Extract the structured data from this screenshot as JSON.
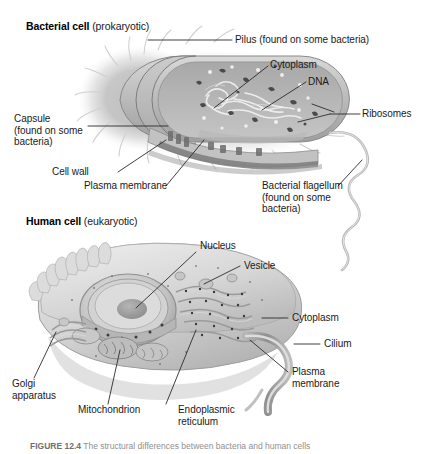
{
  "figure": {
    "background": "#ffffff",
    "line_color": "#2b2b2b",
    "text_color": "#1a1a1a",
    "caption_number": "FIGURE 12.4",
    "caption_text": "The structural differences between bacteria and human cells"
  },
  "sections": [
    {
      "id": "bacterial",
      "title_bold": "Bacterial cell",
      "title_regular": "(prokaryotic)"
    },
    {
      "id": "human",
      "title_bold": "Human cell",
      "title_regular": "(eukaryotic)"
    }
  ],
  "bacterial_labels": [
    {
      "id": "pilus",
      "text": "Pilus (found on some bacteria)"
    },
    {
      "id": "cytoplasm",
      "text": "Cytoplasm"
    },
    {
      "id": "dna",
      "text": "DNA"
    },
    {
      "id": "ribosomes",
      "text": "Ribosomes"
    },
    {
      "id": "capsule",
      "text": "Capsule\n(found on some\nbacteria)"
    },
    {
      "id": "cell-wall",
      "text": "Cell wall"
    },
    {
      "id": "plasma-membrane",
      "text": "Plasma membrane"
    },
    {
      "id": "flagellum",
      "text": "Bacterial flagellum\n(found on some\nbacteria)"
    }
  ],
  "human_labels": [
    {
      "id": "nucleus",
      "text": "Nucleus"
    },
    {
      "id": "vesicle",
      "text": "Vesicle"
    },
    {
      "id": "cytoplasm",
      "text": "Cytoplasm"
    },
    {
      "id": "cilium",
      "text": "Cilium"
    },
    {
      "id": "plasma-membrane",
      "text": "Plasma\nmembrane"
    },
    {
      "id": "golgi",
      "text": "Golgi\napparatus"
    },
    {
      "id": "mitochondrion",
      "text": "Mitochondrion"
    },
    {
      "id": "er",
      "text": "Endoplasmic\nreticulum"
    }
  ]
}
